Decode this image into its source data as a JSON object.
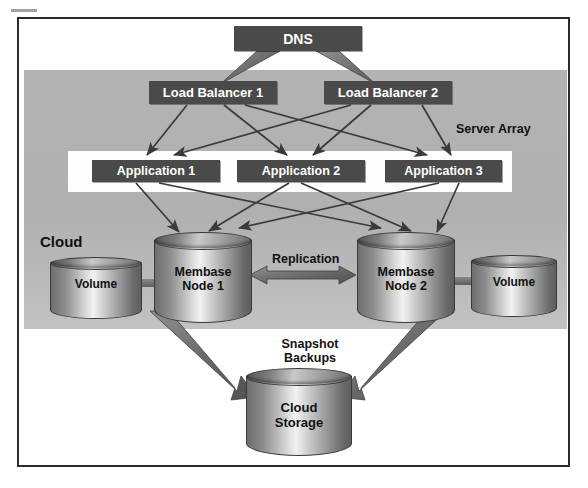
{
  "diagram": {
    "colors": {
      "box_fill": "#4a4a4a",
      "box_text": "#ffffff",
      "cloud_band": "#b3b3b3",
      "server_array_band": "#fdfdfd",
      "frame_border": "#2b2b2b",
      "arrow": "#3a3a3a",
      "label_text": "#111111"
    },
    "regions": {
      "cloud_label": "Cloud",
      "server_array_label": "Server Array"
    },
    "nodes": {
      "dns": "DNS",
      "load_balancer_1": "Load Balancer 1",
      "load_balancer_2": "Load Balancer 2",
      "application_1": "Application 1",
      "application_2": "Application 2",
      "application_3": "Application 3",
      "volume_left": "Volume",
      "volume_right": "Volume",
      "membase_node_1": "Membase\nNode 1",
      "membase_node_1_line1": "Membase",
      "membase_node_1_line2": "Node 1",
      "membase_node_2_line1": "Membase",
      "membase_node_2_line2": "Node 2",
      "cloud_storage_line1": "Cloud",
      "cloud_storage_line2": "Storage"
    },
    "edge_labels": {
      "replication": "Replication",
      "snapshot_backups_line1": "Snapshot",
      "snapshot_backups_line2": "Backups"
    },
    "edges": [
      {
        "from": "DNS",
        "to": "Load Balancer 1",
        "style": "thick-arrow"
      },
      {
        "from": "DNS",
        "to": "Load Balancer 2",
        "style": "thick-arrow"
      },
      {
        "from": "Load Balancer 1",
        "to": "Application 1",
        "style": "arrow"
      },
      {
        "from": "Load Balancer 1",
        "to": "Application 2",
        "style": "arrow"
      },
      {
        "from": "Load Balancer 1",
        "to": "Application 3",
        "style": "arrow"
      },
      {
        "from": "Load Balancer 2",
        "to": "Application 1",
        "style": "arrow"
      },
      {
        "from": "Load Balancer 2",
        "to": "Application 2",
        "style": "arrow"
      },
      {
        "from": "Load Balancer 2",
        "to": "Application 3",
        "style": "arrow"
      },
      {
        "from": "Application 1",
        "to": "Membase Node 1",
        "style": "arrow"
      },
      {
        "from": "Application 1",
        "to": "Membase Node 2",
        "style": "arrow"
      },
      {
        "from": "Application 2",
        "to": "Membase Node 1",
        "style": "arrow"
      },
      {
        "from": "Application 2",
        "to": "Membase Node 2",
        "style": "arrow"
      },
      {
        "from": "Application 3",
        "to": "Membase Node 1",
        "style": "arrow"
      },
      {
        "from": "Application 3",
        "to": "Membase Node 2",
        "style": "arrow"
      },
      {
        "from": "Membase Node 1",
        "to": "Membase Node 2",
        "style": "double-arrow",
        "label": "Replication"
      },
      {
        "from": "Volume",
        "to": "Membase Node 1",
        "style": "connector"
      },
      {
        "from": "Membase Node 2",
        "to": "Volume",
        "style": "connector"
      },
      {
        "from": "Membase Node 1",
        "to": "Cloud Storage",
        "style": "thick-arrow",
        "label": "Snapshot Backups"
      },
      {
        "from": "Membase Node 2",
        "to": "Cloud Storage",
        "style": "thick-arrow",
        "label": "Snapshot Backups"
      }
    ]
  }
}
